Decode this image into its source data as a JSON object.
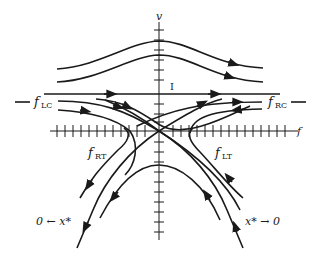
{
  "diagram": {
    "type": "phase-plane",
    "axes": {
      "vertical_label": "v",
      "horizontal_label": "f"
    },
    "labels": {
      "separatrix_marker": "I",
      "f_lc": {
        "base": "f",
        "sub": "LC"
      },
      "f_rc": {
        "base": "f",
        "sub": "RC"
      },
      "f_rt": {
        "base": "f",
        "sub": "RT"
      },
      "f_lt": {
        "base": "f",
        "sub": "LT"
      },
      "left_limit": "0 ← x*",
      "right_limit": "x* → 0"
    },
    "colors": {
      "ink": "#1a1a1a",
      "background": "#ffffff"
    }
  }
}
